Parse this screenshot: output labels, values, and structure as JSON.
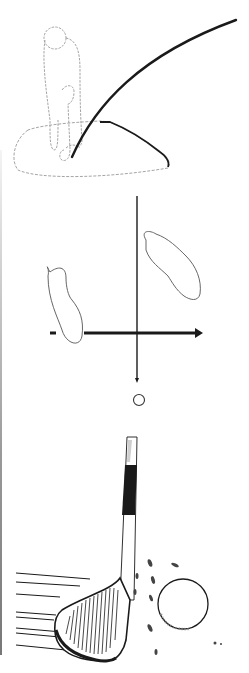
{
  "illustration": {
    "panels": [
      {
        "id": "golfer-swing",
        "description": "Golfer at address on a sand mound with ball flight trajectory"
      },
      {
        "id": "stance-diagram",
        "description": "Overhead view of foot placement with target line arrow and ball"
      },
      {
        "id": "wedge-impact",
        "description": "Sand wedge striking through sand behind the golf ball"
      }
    ]
  },
  "colors": {
    "ink": "#1a1a1a",
    "light_ink": "#8a8a8a",
    "background": "#ffffff",
    "border": "#8c8c8c"
  }
}
